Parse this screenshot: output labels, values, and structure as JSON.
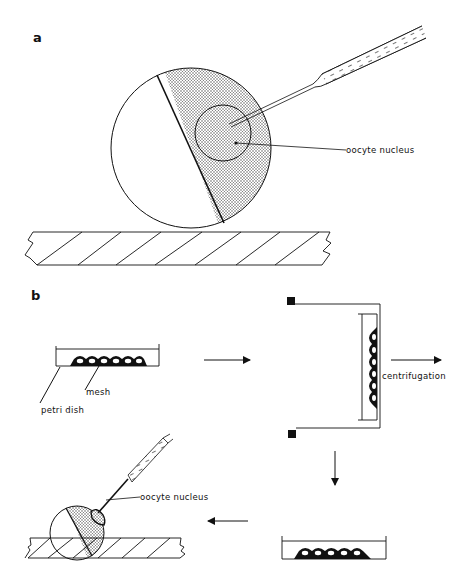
{
  "figure": {
    "panels": [
      {
        "id": "a",
        "label": "a",
        "annotations": {
          "nucleus_label": "oocyte nucleus"
        }
      },
      {
        "id": "b",
        "label": "b",
        "annotations": {
          "petri_dish_label": "petri  dish",
          "mesh_label": "mesh",
          "centrifugation_label": "centrifugation",
          "nucleus_label": "oocyte nucleus"
        },
        "steps": [
          "oocytes on mesh in petri dish",
          "centrifugation",
          "oocytes in petri dish after centrifugation",
          "nucleus injection"
        ]
      }
    ],
    "colors": {
      "ink": "#111111",
      "stipple": "#9a9a9a",
      "background": "#ffffff"
    }
  }
}
